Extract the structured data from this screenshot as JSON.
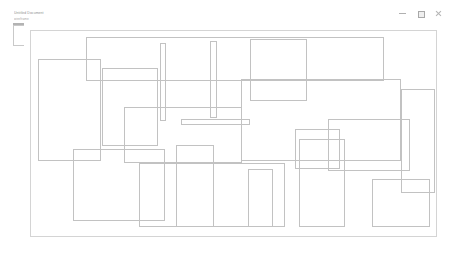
{
  "window": {
    "title_line_1": "Untitled Document",
    "title_line_2": "wireframe",
    "background_color": "#ffffff",
    "border_color": "#d4d4d4"
  },
  "controls": {
    "minimize": {
      "name": "minimize-button",
      "glyph": "–",
      "label": "Minimize"
    },
    "maximize": {
      "name": "maximize-button",
      "glyph": "□",
      "label": "Maximize"
    },
    "close": {
      "name": "close-button",
      "glyph": "×",
      "label": "Close"
    }
  },
  "canvas": {
    "x": 30,
    "y": 30,
    "width": 407,
    "height": 207,
    "stroke_color": "#c2c2c2",
    "fill": "none"
  },
  "shapes": [
    {
      "id": "rect-1",
      "name": "wireframe-rect-tall-left",
      "x": 7,
      "y": 28,
      "w": 63,
      "h": 102
    },
    {
      "id": "rect-2",
      "name": "wireframe-rect-upper-left-mid",
      "x": 71,
      "y": 37,
      "w": 56,
      "h": 78
    },
    {
      "id": "rect-3",
      "name": "wireframe-bar-vertical-left",
      "x": 129,
      "y": 12,
      "w": 6,
      "h": 78
    },
    {
      "id": "rect-4",
      "name": "wireframe-bar-vertical-right",
      "x": 179,
      "y": 10,
      "w": 7,
      "h": 77
    },
    {
      "id": "rect-5",
      "name": "wireframe-bar-horizontal",
      "x": 150,
      "y": 88,
      "w": 69,
      "h": 6
    },
    {
      "id": "rect-6",
      "name": "wireframe-rect-upper-center",
      "x": 219,
      "y": 8,
      "w": 57,
      "h": 62
    },
    {
      "id": "rect-7",
      "name": "wireframe-rect-wide-upper-right",
      "x": 210,
      "y": 48,
      "w": 160,
      "h": 82
    },
    {
      "id": "rect-8",
      "name": "wireframe-rect-right-inner",
      "x": 264,
      "y": 98,
      "w": 45,
      "h": 40
    },
    {
      "id": "rect-9",
      "name": "wireframe-rect-far-right-upper",
      "x": 297,
      "y": 88,
      "w": 82,
      "h": 52
    },
    {
      "id": "rect-10",
      "name": "wireframe-rect-lower-left",
      "x": 42,
      "y": 118,
      "w": 92,
      "h": 72
    },
    {
      "id": "rect-11",
      "name": "wireframe-rect-lower-left-tall",
      "x": 145,
      "y": 114,
      "w": 38,
      "h": 82
    },
    {
      "id": "rect-12",
      "name": "wireframe-rect-lower-center",
      "x": 217,
      "y": 138,
      "w": 25,
      "h": 58
    },
    {
      "id": "rect-13",
      "name": "wireframe-rect-lower-mid-tall",
      "x": 268,
      "y": 108,
      "w": 46,
      "h": 88
    },
    {
      "id": "rect-14",
      "name": "wireframe-rect-lower-right",
      "x": 341,
      "y": 148,
      "w": 58,
      "h": 48
    },
    {
      "id": "rect-15",
      "name": "wireframe-rect-mid-crossing",
      "x": 93,
      "y": 76,
      "w": 118,
      "h": 56
    },
    {
      "id": "rect-16",
      "name": "wireframe-rect-bottom-wide",
      "x": 108,
      "y": 132,
      "w": 146,
      "h": 64
    },
    {
      "id": "rect-17",
      "name": "wireframe-rect-top-band",
      "x": 55,
      "y": 6,
      "w": 298,
      "h": 44
    },
    {
      "id": "rect-18",
      "name": "wireframe-rect-right-edge-tall",
      "x": 370,
      "y": 58,
      "w": 34,
      "h": 104
    }
  ]
}
